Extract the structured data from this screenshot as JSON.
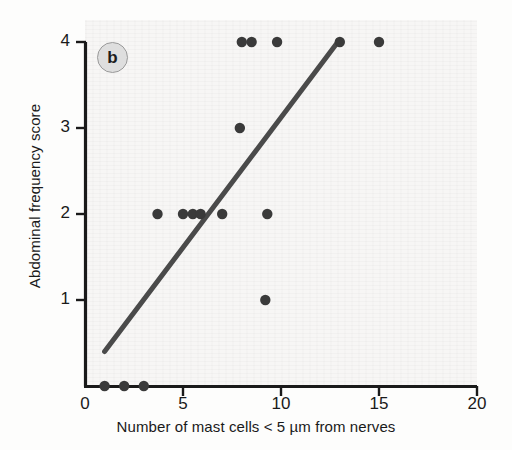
{
  "figure": {
    "panel_label": "b",
    "background_color": "#f7f6f5",
    "point_color": "#3a3a3a",
    "line_color": "#4a4a4a",
    "axis_color": "#1a1a1a"
  },
  "chart_data": {
    "type": "scatter",
    "title": "",
    "xlabel": "Number of mast cells < 5 µm from nerves",
    "ylabel": "Abdominal frequency score",
    "xlim": [
      0,
      20
    ],
    "ylim": [
      0,
      4
    ],
    "xticks": [
      0,
      5,
      10,
      15,
      20
    ],
    "xtick_labels": [
      "0",
      "5",
      "10",
      "15",
      "20"
    ],
    "yticks": [
      1,
      2,
      3,
      4
    ],
    "ytick_labels": [
      "1",
      "2",
      "3",
      "4"
    ],
    "grid": false,
    "legend": false,
    "points": [
      {
        "x": 1.0,
        "y": 0
      },
      {
        "x": 2.0,
        "y": 0
      },
      {
        "x": 3.0,
        "y": 0
      },
      {
        "x": 3.7,
        "y": 2
      },
      {
        "x": 5.0,
        "y": 2
      },
      {
        "x": 5.5,
        "y": 2
      },
      {
        "x": 5.9,
        "y": 2
      },
      {
        "x": 7.0,
        "y": 2
      },
      {
        "x": 9.3,
        "y": 2
      },
      {
        "x": 9.2,
        "y": 1
      },
      {
        "x": 7.9,
        "y": 3
      },
      {
        "x": 8.0,
        "y": 4
      },
      {
        "x": 8.5,
        "y": 4
      },
      {
        "x": 9.8,
        "y": 4
      },
      {
        "x": 13.0,
        "y": 4
      },
      {
        "x": 15.0,
        "y": 4
      }
    ],
    "series": [
      {
        "name": "observations",
        "type": "scatter",
        "x": [
          1.0,
          2.0,
          3.0,
          3.7,
          5.0,
          5.5,
          5.9,
          7.0,
          9.3,
          9.2,
          7.9,
          8.0,
          8.5,
          9.8,
          13.0,
          15.0
        ],
        "y": [
          0,
          0,
          0,
          2,
          2,
          2,
          2,
          2,
          2,
          1,
          3,
          4,
          4,
          4,
          4,
          4
        ]
      },
      {
        "name": "regression-line",
        "type": "line",
        "x": [
          1.0,
          12.9
        ],
        "y": [
          0.4,
          4.0
        ]
      }
    ],
    "annotations": [
      {
        "name": "panel-label",
        "text": "b",
        "x": 1.4,
        "y": 3.8
      }
    ]
  }
}
